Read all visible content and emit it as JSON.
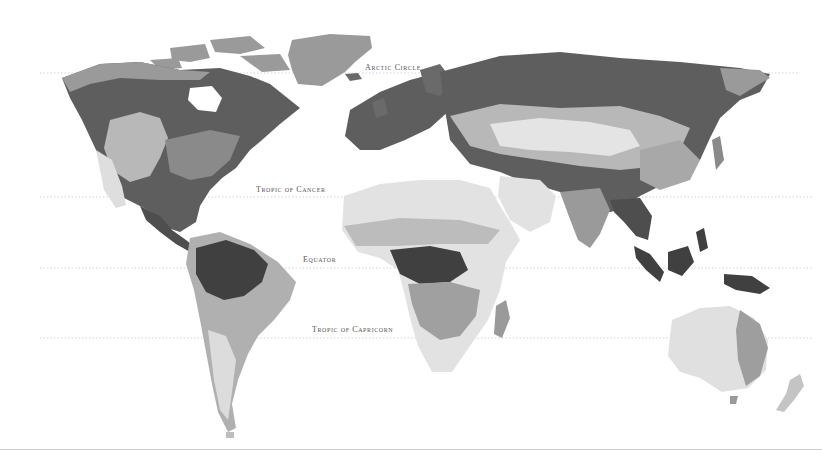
{
  "map": {
    "title": "World biome map (greyscale)",
    "style": "greyscale",
    "palette": {
      "water": "#ffffff",
      "tundra": "#9a9a9a",
      "boreal_forest": "#5e5e5e",
      "temperate_forest": "#8a8a8a",
      "grassland": "#b8b8b8",
      "desert": "#e2e2e2",
      "tropical_rainforest": "#404040",
      "savanna": "#a6a6a6",
      "mountains": "#cccccc",
      "ice": "#aaaaaa"
    },
    "latitude_lines": [
      {
        "name": "arctic-circle",
        "label": "Arctic Circle",
        "y": 73,
        "label_x": 365,
        "label_y": 63
      },
      {
        "name": "tropic-of-cancer",
        "label": "Tropic of Cancer",
        "y": 197,
        "label_x": 256,
        "label_y": 185
      },
      {
        "name": "equator",
        "label": "Equator",
        "y": 268,
        "label_x": 303,
        "label_y": 255
      },
      {
        "name": "tropic-of-capricorn",
        "label": "Tropic of Capricorn",
        "y": 338,
        "label_x": 312,
        "label_y": 325
      }
    ],
    "regions": [
      "North America",
      "Greenland",
      "South America",
      "Europe",
      "Africa",
      "Asia",
      "Australia",
      "Indonesia",
      "New Zealand",
      "Madagascar"
    ]
  }
}
